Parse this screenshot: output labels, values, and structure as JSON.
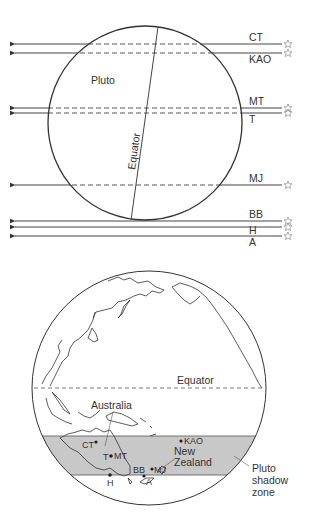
{
  "top_diagram": {
    "body_label": "Pluto",
    "equator_label": "Equator",
    "chords": [
      {
        "label": "CT",
        "y": 44,
        "label_pos": "above"
      },
      {
        "label": "KAO",
        "y": 53,
        "label_pos": "below"
      },
      {
        "label": "MT",
        "y": 108,
        "label_pos": "above"
      },
      {
        "label": "T",
        "y": 113,
        "label_pos": "below"
      },
      {
        "label": "MJ",
        "y": 185,
        "label_pos": "above"
      },
      {
        "label": "BB",
        "y": 221,
        "label_pos": "above"
      },
      {
        "label": "H",
        "y": 227,
        "label_pos": "below"
      },
      {
        "label": "A",
        "y": 236,
        "label_pos": "below"
      }
    ],
    "star_icon": "star-icon"
  },
  "bottom_diagram": {
    "equator_label": "Equator",
    "australia_label": "Australia",
    "new_zealand_label_line1": "New",
    "new_zealand_label_line2": "Zealand",
    "shadow_label_line1": "Pluto",
    "shadow_label_line2": "shadow",
    "shadow_label_line3": "zone",
    "stations": [
      {
        "label": "CT"
      },
      {
        "label": "T"
      },
      {
        "label": "MT"
      },
      {
        "label": "H"
      },
      {
        "label": "KAO"
      },
      {
        "label": "BB"
      },
      {
        "label": "MJ"
      },
      {
        "label": "A"
      }
    ],
    "colors": {
      "shadow_zone": "#c8c8c8",
      "line": "#333333"
    }
  }
}
